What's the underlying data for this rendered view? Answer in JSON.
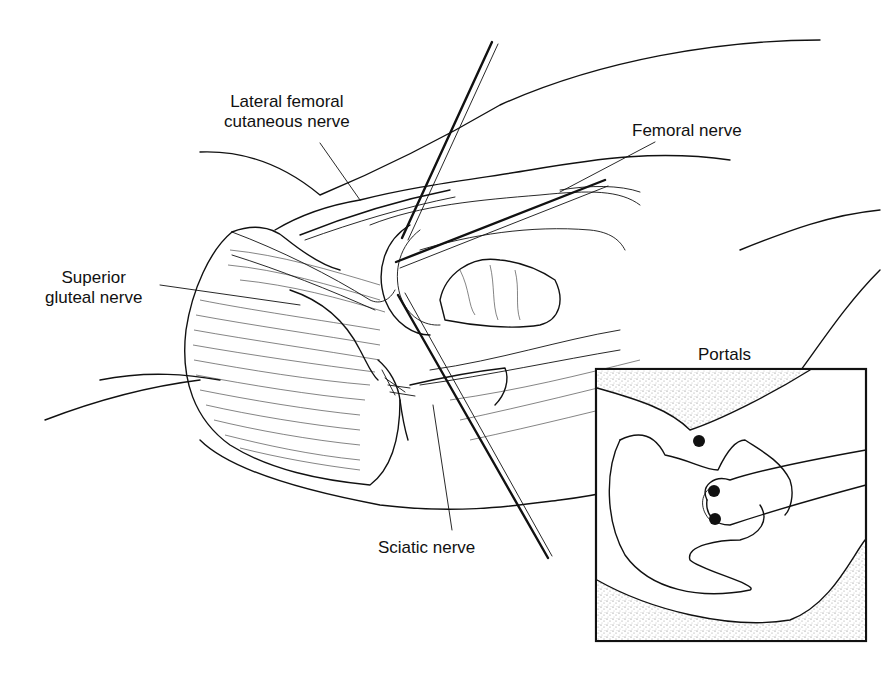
{
  "figure": {
    "type": "anatomical-illustration",
    "labels": [
      {
        "id": "lfcn",
        "lines": [
          "Lateral femoral",
          "cutaneous nerve"
        ]
      },
      {
        "id": "femoral",
        "lines": [
          "Femoral nerve"
        ]
      },
      {
        "id": "sup-gluteal",
        "lines": [
          "Superior",
          "gluteal nerve"
        ]
      },
      {
        "id": "sciatic",
        "lines": [
          "Sciatic nerve"
        ]
      }
    ],
    "inset": {
      "title": "Portals",
      "portal_count": 3
    }
  },
  "colors": {
    "ink": "#111111",
    "background": "#ffffff",
    "stipple": "#9a9a9a"
  }
}
